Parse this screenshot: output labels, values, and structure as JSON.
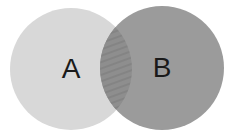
{
  "diagram": {
    "type": "venn",
    "sets": [
      {
        "id": "A",
        "label": "A",
        "cx": 71,
        "cy": 69,
        "r": 61,
        "color": "#d8d8d8"
      },
      {
        "id": "B",
        "label": "B",
        "cx": 162,
        "cy": 68,
        "r": 62,
        "color": "#9b9b9b"
      }
    ],
    "intersection": {
      "sets": [
        "A",
        "B"
      ],
      "fill": "#8e8e8e",
      "hatch_color": "#7a7a7a",
      "pattern": "diagonal-hatch"
    },
    "background": "#ffffff"
  }
}
